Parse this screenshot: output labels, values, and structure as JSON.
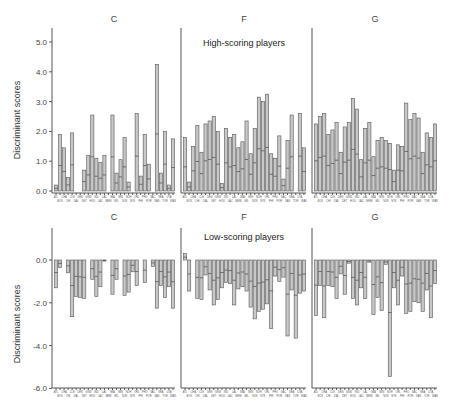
{
  "chart_data": [
    {
      "type": "bar",
      "group": "High-scoring players",
      "panel": "C",
      "title": "C",
      "ylabel": "Discriminant scores",
      "ylim": [
        0,
        5.4
      ],
      "yticks": [
        "0.0",
        "1.0",
        "2.0",
        "3.0",
        "4.0",
        "5.0"
      ],
      "categories": [
        "ATL",
        "BOS",
        "CHA",
        "CHI",
        "CLE",
        "DAL",
        "DEN",
        "DET",
        "GSW",
        "HOU",
        "IND",
        "LAC",
        "LAL",
        "MEM",
        "MIA",
        "MIL",
        "MIN",
        "NJN",
        "NOH",
        "NYK",
        "ORL",
        "PHI",
        "PHO",
        "POR",
        "SAC",
        "SAS",
        "SEA",
        "TOR",
        "UTA",
        "WAS"
      ],
      "values": [
        0.2,
        1.9,
        1.45,
        0.45,
        1.95,
        null,
        null,
        0.7,
        1.2,
        2.55,
        1.1,
        0.95,
        1.2,
        null,
        2.55,
        0.6,
        1.05,
        1.8,
        0.3,
        null,
        2.6,
        0.5,
        1.9,
        0.9,
        null,
        4.25,
        0.6,
        2.0,
        0.2,
        1.75
      ]
    },
    {
      "type": "bar",
      "group": "High-scoring players",
      "panel": "F",
      "title": "F",
      "subtitle": "High-scoring players",
      "ylim": [
        0,
        5.4
      ],
      "categories": [
        "ATL",
        "BOS",
        "CHA",
        "CHI",
        "CLE",
        "DAL",
        "DEN",
        "DET",
        "GSW",
        "HOU",
        "IND",
        "LAC",
        "LAL",
        "MEM",
        "MIA",
        "MIL",
        "MIN",
        "NJN",
        "NOH",
        "NYK",
        "ORL",
        "PHI",
        "PHO",
        "POR",
        "SAC",
        "SAS",
        "SEA",
        "TOR",
        "UTA",
        "WAS"
      ],
      "values": [
        1.8,
        0.3,
        1.5,
        2.2,
        1.3,
        2.25,
        2.35,
        2.5,
        2.0,
        0.25,
        2.1,
        1.8,
        1.9,
        1.45,
        1.65,
        2.35,
        1.25,
        2.1,
        3.15,
        3.0,
        3.25,
        1.25,
        1.1,
        1.85,
        0.4,
        1.7,
        2.55,
        null,
        2.6,
        1.45
      ]
    },
    {
      "type": "bar",
      "group": "High-scoring players",
      "panel": "G",
      "title": "G",
      "ylim": [
        0,
        5.4
      ],
      "categories": [
        "ATL",
        "BOS",
        "CHA",
        "CHI",
        "CLE",
        "DAL",
        "DEN",
        "DET",
        "GSW",
        "HOU",
        "IND",
        "LAC",
        "LAL",
        "MEM",
        "MIA",
        "MIL",
        "MIN",
        "NJN",
        "NOH",
        "NYK",
        "ORL",
        "PHI",
        "PHO",
        "POR",
        "SAC",
        "SAS",
        "SEA",
        "TOR",
        "UTA",
        "WAS"
      ],
      "values": [
        2.25,
        2.5,
        2.6,
        1.9,
        2.05,
        2.3,
        1.3,
        2.15,
        2.3,
        3.1,
        2.75,
        1.05,
        2.1,
        2.3,
        1.15,
        1.7,
        1.8,
        1.7,
        1.6,
        0.7,
        1.55,
        1.5,
        2.95,
        2.4,
        2.6,
        2.45,
        1.3,
        1.95,
        1.8,
        2.25
      ]
    },
    {
      "type": "bar",
      "group": "Low-scoring players",
      "panel": "C",
      "title": "C",
      "ylabel": "Discriminant scores",
      "ylim": [
        -6.0,
        2.0
      ],
      "yticks": [
        "0.0",
        "-2.0",
        "-4.0",
        "-6.0"
      ],
      "categories": [
        "ATL",
        "BOS",
        "CHA",
        "CHI",
        "CLE",
        "DAL",
        "DEN",
        "DET",
        "GSW",
        "HOU",
        "IND",
        "LAC",
        "LAL",
        "MEM",
        "MIA",
        "MIL",
        "MIN",
        "NJN",
        "NOH",
        "NYK",
        "ORL",
        "PHI",
        "PHO",
        "POR",
        "SAC",
        "SAS",
        "SEA",
        "TOR",
        "UTA",
        "WAS"
      ],
      "values": [
        -1.3,
        -0.35,
        null,
        -0.6,
        -2.65,
        -1.7,
        -1.75,
        -1.8,
        null,
        -0.9,
        -1.7,
        -1.25,
        -0.05,
        null,
        -1.6,
        -0.9,
        null,
        -1.65,
        -1.5,
        -0.55,
        -1.2,
        null,
        -1.05,
        null,
        -0.3,
        -2.25,
        -1.2,
        -1.75,
        -1.25,
        -2.25
      ]
    },
    {
      "type": "bar",
      "group": "Low-scoring players",
      "panel": "F",
      "title": "F",
      "subtitle": "Low-scoring players",
      "ylim": [
        -6.0,
        2.0
      ],
      "categories": [
        "ATL",
        "BOS",
        "CHA",
        "CHI",
        "CLE",
        "DAL",
        "DEN",
        "DET",
        "GSW",
        "HOU",
        "IND",
        "LAC",
        "LAL",
        "MEM",
        "MIA",
        "MIL",
        "MIN",
        "NJN",
        "NOH",
        "NYK",
        "ORL",
        "PHI",
        "PHO",
        "POR",
        "SAC",
        "SAS",
        "SEA",
        "TOR",
        "UTA",
        "WAS"
      ],
      "values": [
        0.3,
        -1.45,
        null,
        -1.8,
        -1.85,
        -0.7,
        -1.4,
        -2.1,
        -1.85,
        -1.3,
        -1.05,
        -1.1,
        -2.1,
        -1.35,
        -1.25,
        -1.45,
        -2.2,
        -2.75,
        -2.4,
        -2.3,
        -2.05,
        -3.2,
        -0.75,
        -1.0,
        -0.8,
        -3.55,
        -1.4,
        -3.65,
        -1.55,
        -1.45
      ]
    },
    {
      "type": "bar",
      "group": "Low-scoring players",
      "panel": "G",
      "title": "G",
      "ylim": [
        -6.0,
        2.0
      ],
      "categories": [
        "ATL",
        "BOS",
        "CHA",
        "CHI",
        "CLE",
        "DAL",
        "DEN",
        "DET",
        "GSW",
        "HOU",
        "IND",
        "LAC",
        "LAL",
        "MEM",
        "MIA",
        "MIL",
        "MIN",
        "NJN",
        "NOH",
        "NYK",
        "ORL",
        "PHI",
        "PHO",
        "POR",
        "SAC",
        "SAS",
        "SEA",
        "TOR",
        "UTA",
        "WAS"
      ],
      "values": [
        -2.6,
        -1.2,
        -2.7,
        -1.2,
        -1.25,
        -1.8,
        -0.65,
        -1.6,
        -0.15,
        -1.8,
        -2.1,
        -1.3,
        -1.8,
        -0.1,
        -2.55,
        -1.75,
        -2.35,
        -0.2,
        -5.45,
        -1.3,
        -2.1,
        -0.75,
        -2.5,
        -2.4,
        -1.95,
        -2.0,
        -2.4,
        -1.4,
        -2.7,
        -1.1
      ]
    }
  ],
  "labels": {
    "ylabel": "Discriminant scores",
    "top_subtitle": "High-scoring players",
    "bottom_subtitle": "Low-scoring players",
    "panel_titles": [
      "C",
      "F",
      "G"
    ]
  }
}
